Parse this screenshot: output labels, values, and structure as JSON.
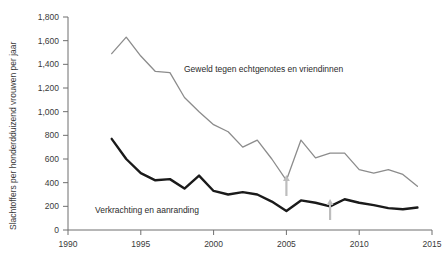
{
  "chart_data": {
    "type": "line",
    "title": "",
    "xlabel": "",
    "ylabel": "Slachtoffers per honderdduizend vrouwen per jaar",
    "xlim": [
      1990,
      2015
    ],
    "ylim": [
      0,
      1800
    ],
    "grid": false,
    "legend_position": "inline-annotation",
    "xticks": [
      "1990",
      "1995",
      "2000",
      "2005",
      "2010",
      "2015"
    ],
    "xtick_values": [
      1990,
      1995,
      2000,
      2005,
      2010,
      2015
    ],
    "yticks": [
      "0",
      "200",
      "400",
      "600",
      "800",
      "1,000",
      "1,200",
      "1,400",
      "1,600",
      "1,800"
    ],
    "ytick_values": [
      0,
      200,
      400,
      600,
      800,
      1000,
      1200,
      1400,
      1600,
      1800
    ],
    "series": [
      {
        "name": "Geweld tegen echtgenotes en vriendinnen",
        "color": "#8c8c8c",
        "x": [
          1993,
          1994,
          1995,
          1996,
          1997,
          1998,
          1999,
          2000,
          2001,
          2002,
          2003,
          2004,
          2005,
          2006,
          2007,
          2008,
          2009,
          2010,
          2011,
          2012,
          2013,
          2014
        ],
        "values": [
          1490,
          1630,
          1470,
          1340,
          1330,
          1120,
          1000,
          890,
          830,
          700,
          760,
          600,
          420,
          760,
          610,
          650,
          650,
          510,
          480,
          510,
          470,
          370
        ]
      },
      {
        "name": "Verkrachting en aanranding",
        "color": "#1a1a1a",
        "x": [
          1993,
          1994,
          1995,
          1996,
          1997,
          1998,
          1999,
          2000,
          2001,
          2002,
          2003,
          2004,
          2005,
          2006,
          2007,
          2008,
          2009,
          2010,
          2011,
          2012,
          2013,
          2014
        ],
        "values": [
          770,
          600,
          480,
          420,
          430,
          350,
          460,
          330,
          300,
          320,
          300,
          240,
          160,
          250,
          230,
          200,
          260,
          230,
          210,
          185,
          175,
          190
        ]
      }
    ],
    "annotations": [
      {
        "name": "arrow-marker-2005",
        "x": 2005,
        "label": "",
        "shape": "up-arrow",
        "color": "#bdbdbd"
      },
      {
        "name": "arrow-marker-2008",
        "x": 2008,
        "label": "",
        "shape": "up-arrow",
        "color": "#bdbdbd"
      }
    ]
  },
  "labels": {
    "series_upper": "Geweld tegen echtgenotes en vriendinnen",
    "series_lower": "Verkrachting en aanranding",
    "y_axis_title": "Slachtoffers per honderdduizend vrouwen per jaar"
  }
}
